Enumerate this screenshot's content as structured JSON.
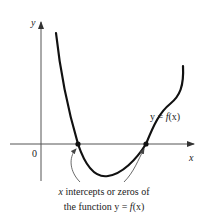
{
  "figure": {
    "axes": {
      "y_label": "y",
      "x_label": "x",
      "origin_label": "0"
    },
    "curve": {
      "label_prefix": "y = ",
      "label_func": "f",
      "label_arg": "(x)"
    },
    "caption": {
      "line1_var": "x",
      "line1_rest": " intercepts or zeros of",
      "line2_prefix": "the function y = ",
      "line2_func": "f",
      "line2_arg": "(x)"
    },
    "colors": {
      "axis": "#555555",
      "curve": "#111111",
      "text": "#222222"
    }
  }
}
